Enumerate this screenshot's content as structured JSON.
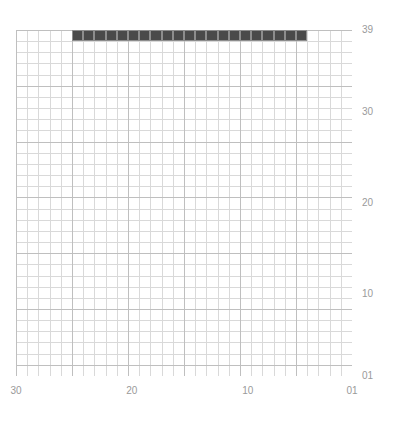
{
  "chart_data": {
    "type": "heatmap",
    "title": "",
    "xlabel": "",
    "ylabel": "",
    "grid": {
      "cols": 30,
      "rows": 31,
      "show_minor": true,
      "show_major": true
    },
    "xlim": [
      30,
      1
    ],
    "ylim": [
      1,
      39
    ],
    "x_ticks": [
      "30",
      "20",
      "10",
      "01"
    ],
    "x_tick_values": [
      30,
      20,
      10,
      1
    ],
    "y_ticks": [
      "39",
      "30",
      "20",
      "10",
      "01"
    ],
    "y_tick_values": [
      39,
      30,
      20,
      10,
      1
    ],
    "legend": [],
    "colors": {
      "fill": "#4a4a4a",
      "cell_edge": "#8d8d8d",
      "grid_minor": "#d9d9d9",
      "grid_major": "#bfbfbf",
      "background": "#ffffff",
      "tick_label": "#9a9a9a"
    },
    "filled_cells": [
      {
        "row": 1,
        "cols": [
          5,
          6,
          7,
          8,
          9,
          10,
          11,
          12,
          18,
          19,
          20,
          21,
          22,
          23,
          24,
          25
        ]
      },
      {
        "row": 2,
        "cols": [
          6,
          7,
          8,
          9,
          10,
          11,
          12,
          19,
          20,
          21,
          22,
          23,
          24
        ]
      },
      {
        "row": 3,
        "cols": [
          7,
          8,
          9,
          10,
          11,
          19,
          20,
          21,
          22,
          23
        ]
      },
      {
        "row": 4,
        "cols": [
          7,
          8,
          9,
          10,
          11,
          20,
          21,
          22
        ]
      },
      {
        "row": 5,
        "cols": [
          8,
          9,
          10,
          11,
          20,
          21,
          22
        ]
      },
      {
        "row": 6,
        "cols": [
          8,
          9,
          10,
          11,
          20,
          21,
          22
        ]
      },
      {
        "row": 7,
        "cols": [
          9,
          10,
          11,
          12,
          20,
          21,
          22
        ]
      },
      {
        "row": 8,
        "cols": [
          9,
          10,
          11,
          12,
          20,
          21
        ]
      },
      {
        "row": 9,
        "cols": [
          9,
          10,
          11,
          12,
          20,
          21
        ]
      },
      {
        "row": 10,
        "cols": [
          10,
          11,
          12,
          13,
          19,
          20,
          21
        ]
      },
      {
        "row": 11,
        "cols": [
          10,
          11,
          12,
          13,
          19,
          20,
          21
        ]
      },
      {
        "row": 12,
        "cols": [
          10,
          11,
          12,
          13,
          19,
          20
        ]
      },
      {
        "row": 13,
        "cols": [
          10,
          11,
          12,
          13,
          19,
          20
        ]
      },
      {
        "row": 14,
        "cols": [
          11,
          12,
          13,
          14,
          18,
          19,
          20
        ]
      },
      {
        "row": 15,
        "cols": [
          11,
          12,
          13,
          14,
          18,
          19,
          20
        ]
      },
      {
        "row": 16,
        "cols": [
          11,
          12,
          13,
          14,
          18,
          19,
          20
        ]
      },
      {
        "row": 17,
        "cols": [
          11,
          12,
          13,
          14,
          18,
          19,
          20
        ]
      },
      {
        "row": 18,
        "cols": [
          12,
          13,
          14,
          15,
          18,
          19,
          20
        ]
      },
      {
        "row": 19,
        "cols": [
          12,
          13,
          14,
          15,
          18,
          19
        ]
      },
      {
        "row": 20,
        "cols": [
          12,
          13,
          14,
          15,
          18,
          19
        ]
      },
      {
        "row": 21,
        "cols": [
          12,
          13,
          14,
          15,
          16,
          17,
          18,
          19
        ]
      },
      {
        "row": 22,
        "cols": [
          13,
          14,
          15,
          16,
          17,
          18,
          19
        ]
      },
      {
        "row": 23,
        "cols": [
          13,
          14,
          15,
          16,
          17,
          18
        ]
      },
      {
        "row": 24,
        "cols": [
          13,
          14,
          15,
          16,
          17,
          18
        ]
      },
      {
        "row": 25,
        "cols": [
          13,
          14,
          15,
          16,
          17
        ]
      },
      {
        "row": 26,
        "cols": [
          14,
          15,
          16
        ]
      },
      {
        "row": 27,
        "cols": [
          14,
          15,
          16
        ]
      },
      {
        "row": 28,
        "cols": [
          14,
          15,
          16
        ]
      }
    ]
  }
}
